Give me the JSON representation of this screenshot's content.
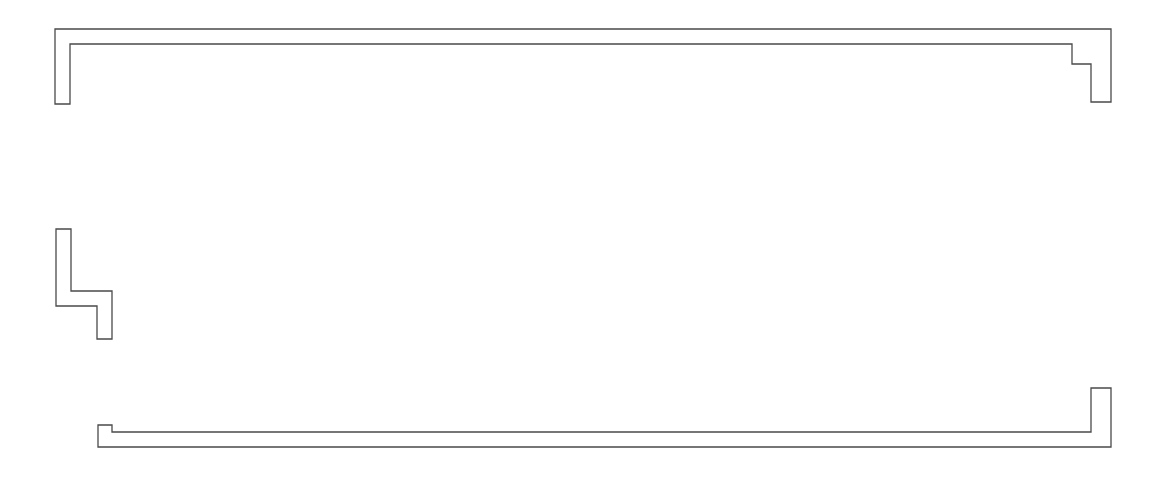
{
  "canvas": {
    "width": 1163,
    "height": 481,
    "background": "#ffffff",
    "stroke": "#4a4a4a"
  },
  "shapes": [
    {
      "name": "top-wall-outline",
      "points": [
        [
          55,
          29
        ],
        [
          1111,
          29
        ],
        [
          1111,
          102
        ],
        [
          1091,
          102
        ],
        [
          1091,
          64
        ],
        [
          1072,
          64
        ],
        [
          1072,
          44
        ],
        [
          70,
          44
        ],
        [
          70,
          104
        ],
        [
          55,
          104
        ]
      ]
    },
    {
      "name": "middle-left-wall-outline",
      "points": [
        [
          56,
          229
        ],
        [
          71,
          229
        ],
        [
          71,
          291
        ],
        [
          112,
          291
        ],
        [
          112,
          339
        ],
        [
          97,
          339
        ],
        [
          97,
          306
        ],
        [
          56,
          306
        ]
      ]
    },
    {
      "name": "bottom-wall-outline",
      "points": [
        [
          98,
          425
        ],
        [
          112,
          425
        ],
        [
          112,
          432
        ],
        [
          1091,
          432
        ],
        [
          1091,
          388
        ],
        [
          1111,
          388
        ],
        [
          1111,
          447
        ],
        [
          98,
          447
        ]
      ]
    }
  ]
}
